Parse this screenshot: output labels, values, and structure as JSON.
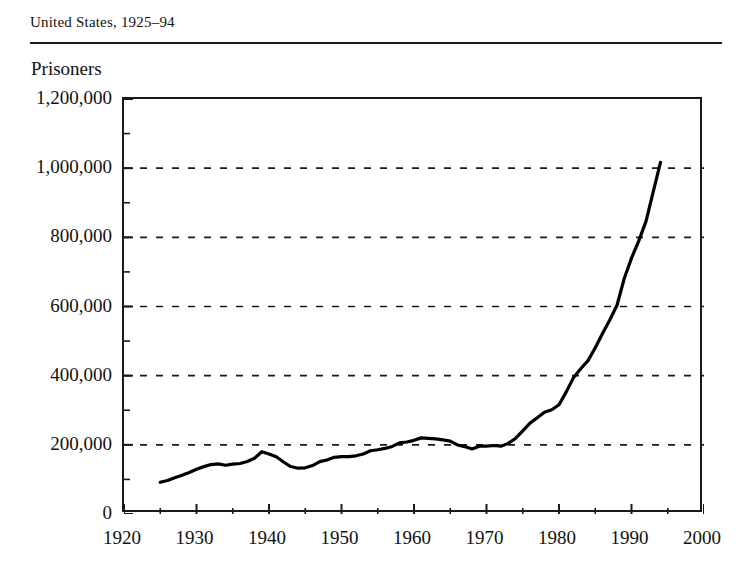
{
  "header": {
    "title": "United States, 1925–94"
  },
  "axis_title": "Prisoners",
  "chart_data": {
    "type": "line",
    "title": "United States, 1925–94",
    "xlabel": "",
    "ylabel": "Prisoners",
    "xlim": [
      1920,
      2000
    ],
    "ylim": [
      0,
      1200000
    ],
    "grid": "horizontal-dashed-major-only",
    "legend": "none",
    "line_color": "#000000",
    "x_major_ticks": [
      1920,
      1930,
      1940,
      1950,
      1960,
      1970,
      1980,
      1990,
      2000
    ],
    "x_minor_tick_interval": 5,
    "y_major_ticks": [
      0,
      200000,
      400000,
      600000,
      800000,
      1000000,
      1200000
    ],
    "y_minor_tick_interval": 100000,
    "x_tick_labels": [
      "1920",
      "1930",
      "1940",
      "1950",
      "1960",
      "1970",
      "1980",
      "1990",
      "2000"
    ],
    "y_tick_labels": [
      "0",
      "200,000",
      "400,000",
      "600,000",
      "800,000",
      "1,000,000",
      "1,200,000"
    ],
    "series": [
      {
        "name": "Prisoners",
        "x": [
          1925,
          1926,
          1927,
          1928,
          1929,
          1930,
          1931,
          1932,
          1933,
          1934,
          1935,
          1936,
          1937,
          1938,
          1939,
          1940,
          1941,
          1942,
          1943,
          1944,
          1945,
          1946,
          1947,
          1948,
          1949,
          1950,
          1951,
          1952,
          1953,
          1954,
          1955,
          1956,
          1957,
          1958,
          1959,
          1960,
          1961,
          1962,
          1963,
          1964,
          1965,
          1966,
          1967,
          1968,
          1969,
          1970,
          1971,
          1972,
          1973,
          1974,
          1975,
          1976,
          1977,
          1978,
          1979,
          1980,
          1981,
          1982,
          1983,
          1984,
          1985,
          1986,
          1987,
          1988,
          1989,
          1990,
          1991,
          1992,
          1993,
          1994
        ],
        "values": [
          91669,
          97000,
          105000,
          112000,
          120000,
          129453,
          137000,
          143000,
          145000,
          141000,
          144000,
          146000,
          152000,
          161000,
          179818,
          173706,
          165439,
          150384,
          137220,
          132456,
          133649,
          140079,
          151304,
          155977,
          163749,
          166123,
          165680,
          168233,
          173579,
          182901,
          185780,
          189565,
          195414,
          205643,
          208105,
          212953,
          220149,
          218830,
          217283,
          214336,
          210895,
          199654,
          194896,
          187914,
          196007,
          196429,
          198061,
          196092,
          204211,
          218466,
          240593,
          262833,
          278141,
          294396,
          301470,
          315974,
          353167,
          394374,
          419820,
          443398,
          480568,
          522084,
          560812,
          603732,
          680907,
          739980,
          789610,
          846277,
          932074,
          1016691
        ]
      }
    ],
    "annotations": []
  }
}
